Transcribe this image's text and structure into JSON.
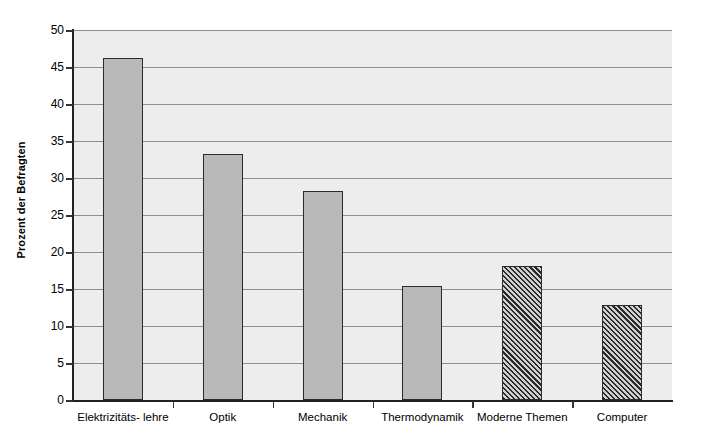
{
  "chart_data": {
    "type": "bar",
    "title": "",
    "subtitle": "",
    "xlabel": "",
    "ylabel": "Prozent der Befragten",
    "categories": [
      "Elektrizitäts- lehre",
      "Optik",
      "Mechanik",
      "Thermodynamik",
      "Moderne Themen",
      "Computer"
    ],
    "values": [
      46.2,
      33.3,
      28.2,
      15.4,
      18.1,
      12.9
    ],
    "bar_styles": [
      "solid",
      "solid",
      "solid",
      "solid",
      "hatched",
      "hatched"
    ],
    "ylim": [
      0,
      50
    ],
    "ytick_values": [
      0,
      5,
      10,
      15,
      20,
      25,
      30,
      35,
      40,
      45,
      50
    ],
    "ytick_labels": [
      "0",
      "5",
      "10",
      "15",
      "20",
      "25",
      "30",
      "35",
      "40",
      "45",
      "50"
    ],
    "grid": "horizontal",
    "legend": "none",
    "annotations": [],
    "colors": {
      "plot_background": "#ededed",
      "figure_background": "#ffffff",
      "gridline": "#8e8e8e",
      "axis_line": "#222222",
      "bar_solid_fill": "#b9b9b9",
      "bar_border": "#2b2b2b",
      "bar_hatch_stroke": "#2a2a2a",
      "bar_hatch_background": "#d0d0d0",
      "text": "#000000"
    }
  }
}
